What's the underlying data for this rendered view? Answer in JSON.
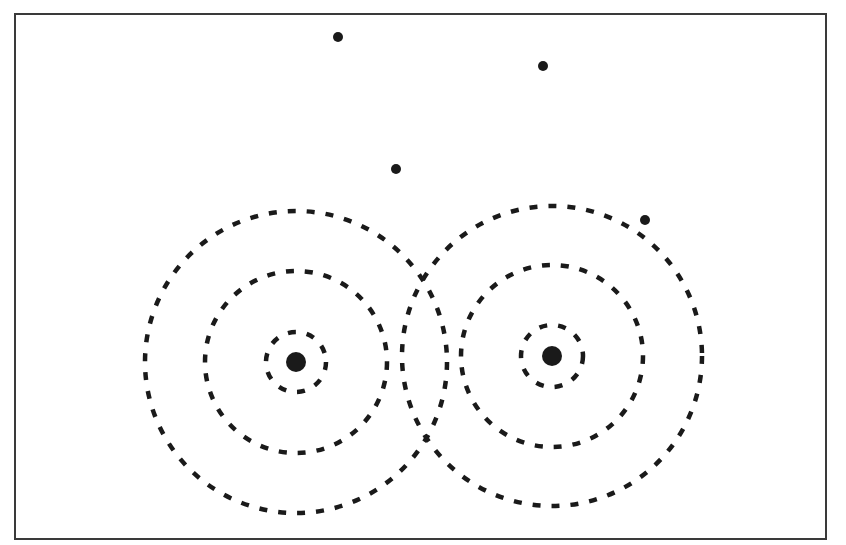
{
  "diagram": {
    "colors": {
      "background": "#ffffff",
      "ink": "#1a1a1a",
      "frame": "#3a3a3a"
    },
    "sources": [
      {
        "id": "left-source",
        "center": [
          296,
          362
        ],
        "dot_radius": 10,
        "rings": [
          {
            "radius": 30
          },
          {
            "radius": 91
          },
          {
            "radius": 151
          }
        ]
      },
      {
        "id": "right-source",
        "center": [
          552,
          356
        ],
        "dot_radius": 10,
        "rings": [
          {
            "radius": 31
          },
          {
            "radius": 91
          },
          {
            "radius": 150
          }
        ]
      }
    ],
    "isolated_points": [
      {
        "x": 338,
        "y": 37,
        "r": 5
      },
      {
        "x": 543,
        "y": 66,
        "r": 5
      },
      {
        "x": 396,
        "y": 169,
        "r": 5
      },
      {
        "x": 645,
        "y": 220,
        "r": 5
      }
    ]
  }
}
